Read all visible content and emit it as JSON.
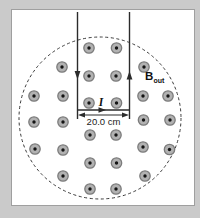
{
  "diagram": {
    "type": "physics-magnetic-field-region-with-hairpin-current",
    "labels": {
      "current": "I",
      "dimension": "20.0 cm",
      "field": "B",
      "field_subscript": "out"
    },
    "colors": {
      "background": "#cacaca",
      "panel": "#ffffff",
      "panel_border": "#9f9f9f",
      "line": "#2b2b2b",
      "boundary": "#3a3a3a",
      "dot_fill": "#b2b2b2",
      "dot_ring": "#7c7c7c",
      "dot_center": "#141414"
    },
    "field_region": {
      "cx": 100,
      "cy": 118,
      "r": 81,
      "style": "dashed"
    },
    "wires": {
      "left_x": 77.5,
      "right_x": 129.5,
      "top_y": 12,
      "bottom_y": 110,
      "tick_bottom_y": 119
    },
    "dimension_line": {
      "y": 115,
      "x1": 78,
      "x2": 129
    },
    "field_dots": [
      [
        89,
        48
      ],
      [
        116.5,
        48
      ],
      [
        62,
        67
      ],
      [
        144,
        67
      ],
      [
        89,
        76
      ],
      [
        116,
        76
      ],
      [
        34,
        96
      ],
      [
        63,
        96
      ],
      [
        143,
        96
      ],
      [
        168,
        96
      ],
      [
        89,
        103
      ],
      [
        116.5,
        103
      ],
      [
        34,
        122
      ],
      [
        63,
        122
      ],
      [
        143.5,
        120
      ],
      [
        170,
        120
      ],
      [
        90,
        135
      ],
      [
        116,
        135
      ],
      [
        35,
        149
      ],
      [
        63,
        150
      ],
      [
        143,
        147
      ],
      [
        169.5,
        149.5
      ],
      [
        90,
        163
      ],
      [
        116.5,
        163
      ],
      [
        63,
        176
      ],
      [
        145,
        176
      ],
      [
        90,
        189
      ],
      [
        116,
        189
      ]
    ],
    "dot_geometry": {
      "outer_radius": 5.2,
      "ring_width": 1.3,
      "center_radius": 1.7
    }
  }
}
